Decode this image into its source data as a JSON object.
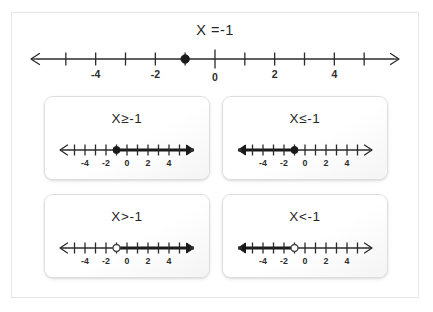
{
  "page": {
    "background_color": "#ffffff",
    "frame_border_color": "#e6e6e6",
    "ink_color": "#2b2b2b"
  },
  "top": {
    "title": "X =-1",
    "number_line": {
      "min": -6,
      "max": 6,
      "tick_step": 1,
      "labeled_ticks": [
        -4,
        -2,
        0,
        2,
        4
      ],
      "labels": [
        "-4",
        "-2",
        "0",
        "2",
        "4"
      ],
      "point_value": -1,
      "point_type": "closed",
      "left_arrow": "thin",
      "right_arrow": "thin",
      "shading": "none"
    }
  },
  "cards": [
    {
      "id": "card-ge",
      "title": "X≥-1",
      "relation": "greater-or-equal",
      "number_line": {
        "min": -6,
        "max": 6,
        "tick_step": 1,
        "labeled_ticks": [
          -4,
          -2,
          0,
          2,
          4
        ],
        "labels": [
          "-4",
          "-2",
          "0",
          "2",
          "4"
        ],
        "point_value": -1,
        "point_type": "closed",
        "shading": "right",
        "left_arrow": "thin",
        "right_arrow": "bold"
      }
    },
    {
      "id": "card-le",
      "title": "X≤-1",
      "relation": "less-or-equal",
      "number_line": {
        "min": -6,
        "max": 6,
        "tick_step": 1,
        "labeled_ticks": [
          -4,
          -2,
          0,
          2,
          4
        ],
        "labels": [
          "-4",
          "-2",
          "0",
          "2",
          "4"
        ],
        "point_value": -1,
        "point_type": "closed",
        "shading": "left",
        "left_arrow": "bold",
        "right_arrow": "thin"
      }
    },
    {
      "id": "card-gt",
      "title": "X>-1",
      "relation": "greater-than",
      "number_line": {
        "min": -6,
        "max": 6,
        "tick_step": 1,
        "labeled_ticks": [
          -4,
          -2,
          0,
          2,
          4
        ],
        "labels": [
          "-4",
          "-2",
          "0",
          "2",
          "4"
        ],
        "point_value": -1,
        "point_type": "open",
        "shading": "right",
        "left_arrow": "thin",
        "right_arrow": "bold"
      }
    },
    {
      "id": "card-lt",
      "title": "X<-1",
      "relation": "less-than",
      "number_line": {
        "min": -6,
        "max": 6,
        "tick_step": 1,
        "labeled_ticks": [
          -4,
          -2,
          0,
          2,
          4
        ],
        "labels": [
          "-4",
          "-2",
          "0",
          "2",
          "4"
        ],
        "point_value": -1,
        "point_type": "open",
        "shading": "left",
        "left_arrow": "bold",
        "right_arrow": "thin"
      }
    }
  ]
}
